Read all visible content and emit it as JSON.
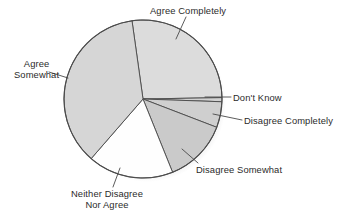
{
  "chart_data": {
    "type": "pie",
    "title": "",
    "subtitle": "",
    "xlabel": "",
    "ylabel": "",
    "legend_position": "none",
    "grid": false,
    "labels_position": "outside-with-leader-lines",
    "categories": [
      "Agree Completely",
      "Don't Know",
      "Disagree Completely",
      "Disagree Somewhat",
      "Neither Disagree Nor Agree",
      "Agree Somewhat"
    ],
    "values": [
      27,
      1,
      5,
      13,
      18,
      36
    ],
    "units": "percent",
    "slices": [
      {
        "label": "Agree Completely",
        "label_lines": [
          "Agree Completely"
        ],
        "value": 27,
        "start_angle": 262,
        "end_angle": 359,
        "sweep": 97,
        "fill": "#dcdcdc"
      },
      {
        "label": "Don't Know",
        "label_lines": [
          "Don't Know"
        ],
        "value": 1,
        "start_angle": 359,
        "end_angle": 362,
        "sweep": 3,
        "fill": "#d2d2d2"
      },
      {
        "label": "Disagree Completely",
        "label_lines": [
          "Disagree Completely"
        ],
        "value": 5,
        "start_angle": 362,
        "end_angle": 381,
        "sweep": 19,
        "fill": "#cfcfcf"
      },
      {
        "label": "Disagree Somewhat",
        "label_lines": [
          "Disagree Somewhat"
        ],
        "value": 13,
        "start_angle": 381,
        "end_angle": 428,
        "sweep": 47,
        "fill": "#cacaca"
      },
      {
        "label": "Neither Disagree Nor Agree",
        "label_lines": [
          "Neither Disagree",
          "Nor Agree"
        ],
        "value": 18,
        "start_angle": 428,
        "end_angle": 491,
        "sweep": 63,
        "fill": "#fefefe"
      },
      {
        "label": "Agree Somewhat",
        "label_lines": [
          "Agree",
          "Somewhat"
        ],
        "value": 36,
        "start_angle": 491,
        "end_angle": 622,
        "sweep": 131,
        "fill": "#d6d6d6"
      }
    ],
    "colors": {
      "outline": "#4a4a4a",
      "text": "#2b2b2b",
      "background": "#ffffff",
      "shadow": "#b9b9b9"
    }
  },
  "labels": {
    "agree_completely": "Agree Completely",
    "agree_somewhat_line1": "Agree",
    "agree_somewhat_line2": "Somewhat",
    "dont_know": "Don't Know",
    "disagree_completely": "Disagree Completely",
    "disagree_somewhat": "Disagree Somewhat",
    "neither_line1": "Neither Disagree",
    "neither_line2": "Nor Agree"
  }
}
